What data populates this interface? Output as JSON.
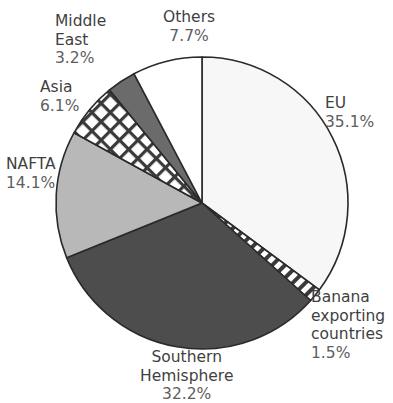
{
  "chart_data": {
    "type": "pie",
    "title": "",
    "title_clipped": true,
    "xlabel": "",
    "ylabel": "",
    "legend": "labels-outside-slices",
    "grid": false,
    "start_angle_deg": 90,
    "direction": "clockwise",
    "units": "%",
    "categories": [
      "EU",
      "Banana exporting countries",
      "Southern Hemisphere",
      "NAFTA",
      "Asia",
      "Middle East",
      "Others"
    ],
    "values": [
      35.1,
      1.5,
      32.2,
      14.1,
      6.1,
      3.2,
      7.7
    ],
    "slices": [
      {
        "label": "EU",
        "label_lines": [
          "EU"
        ],
        "value": 35.1,
        "percent_text": "35.1%",
        "fill": "#f7f7f7",
        "pattern": "solid",
        "stroke": "#2a2a2a"
      },
      {
        "label": "Banana exporting countries",
        "label_lines": [
          "Banana",
          "exporting",
          "countries"
        ],
        "value": 1.5,
        "percent_text": "1.5%",
        "fill": "#ffffff",
        "pattern": "diagonal-stripes",
        "stroke": "#2a2a2a"
      },
      {
        "label": "Southern Hemisphere",
        "label_lines": [
          "Southern",
          "Hemisphere"
        ],
        "value": 32.2,
        "percent_text": "32.2%",
        "fill": "#4d4d4d",
        "pattern": "solid",
        "stroke": "#2a2a2a"
      },
      {
        "label": "NAFTA",
        "label_lines": [
          "NAFTA"
        ],
        "value": 14.1,
        "percent_text": "14.1%",
        "fill": "#b8b8b8",
        "pattern": "solid",
        "stroke": "#2a2a2a"
      },
      {
        "label": "Asia",
        "label_lines": [
          "Asia"
        ],
        "value": 6.1,
        "percent_text": "6.1%",
        "fill": "#ffffff",
        "pattern": "crosshatch",
        "stroke": "#2a2a2a"
      },
      {
        "label": "Middle East",
        "label_lines": [
          "Middle",
          "East"
        ],
        "value": 3.2,
        "percent_text": "3.2%",
        "fill": "#6b6b6b",
        "pattern": "solid",
        "stroke": "#2a2a2a"
      },
      {
        "label": "Others",
        "label_lines": [
          "Others"
        ],
        "value": 7.7,
        "percent_text": "7.7%",
        "fill": "#ffffff",
        "pattern": "solid",
        "stroke": "#2a2a2a"
      }
    ],
    "colors": {
      "eu": "#f7f7f7",
      "southern_hemisphere": "#4d4d4d",
      "nafta": "#b8b8b8",
      "middle_east": "#6b6b6b",
      "others": "#ffffff",
      "outline": "#2a2a2a",
      "label_text": "#4c4c4c"
    }
  },
  "labels": {
    "others": {
      "name": "Others",
      "pct": "7.7%"
    },
    "middle_east": {
      "line1": "Middle",
      "line2": "East",
      "pct": "3.2%"
    },
    "asia": {
      "name": "Asia",
      "pct": "6.1%"
    },
    "nafta": {
      "name": "NAFTA",
      "pct": "14.1%"
    },
    "eu": {
      "name": "EU",
      "pct": "35.1%"
    },
    "banana": {
      "line1": "Banana",
      "line2": "exporting",
      "line3": "countries",
      "pct": "1.5%"
    },
    "southern": {
      "line1": "Southern",
      "line2": "Hemisphere",
      "pct": "32.2%"
    }
  }
}
